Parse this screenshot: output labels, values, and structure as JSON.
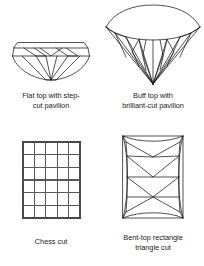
{
  "figure": {
    "background_color": "#ffffff",
    "line_color": "#1a1a1a",
    "grid_line_color": "#595959",
    "text_color": "#1b1b1b"
  },
  "panels": [
    {
      "id": "flat-top-step-cut",
      "diagram_name": "flat-top-step-cut-pavilion-gem",
      "caption_line1": "Flat top with step-",
      "caption_line2": "cut pavilion"
    },
    {
      "id": "buff-top-brilliant-cut",
      "diagram_name": "buff-top-brilliant-cut-pavilion-gem",
      "caption_line1": "Buff top with",
      "caption_line2": "brilliant-cut pavilion"
    },
    {
      "id": "chess-cut",
      "diagram_name": "chess-cut-gem",
      "caption_line1": "Chess cut",
      "caption_line2": "",
      "grid_columns": 5,
      "grid_rows": 6
    },
    {
      "id": "bent-top-rectangle-triangle-cut",
      "diagram_name": "bent-top-rectangle-triangle-cut-gem",
      "caption_line1": "Bent-top rectangle",
      "caption_line2": "triangle cut"
    }
  ]
}
